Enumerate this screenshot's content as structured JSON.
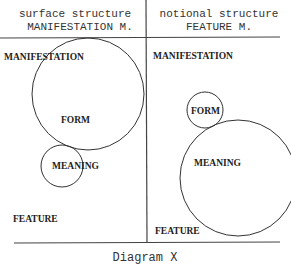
{
  "diagram": {
    "caption": "Diagram X",
    "left_panel": {
      "header_line1": "surface structure",
      "header_line2": "MANIFESTATION M.",
      "top_label": "MANIFESTATION",
      "bottom_label": "FEATURE",
      "large_circle_label": "FORM",
      "small_circle_label": "MEANING"
    },
    "right_panel": {
      "header_line1": "notional structure",
      "header_line2": "FEATURE M.",
      "top_label": "MANIFESTATION",
      "bottom_label": "FEATURE",
      "small_circle_label": "FORM",
      "large_circle_label": "MEANING"
    }
  }
}
